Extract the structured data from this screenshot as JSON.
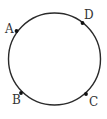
{
  "diagram": {
    "type": "circle-with-points",
    "canvas": {
      "width": 107,
      "height": 119
    },
    "stroke_color": "#2a2a2a",
    "point_color": "#111111",
    "label_color": "#333333",
    "circle": {
      "cx": 54.5,
      "cy": 59,
      "r": 46
    },
    "points": [
      {
        "label": "A",
        "x": 16.5,
        "y": 31,
        "label_x": 5,
        "label_y": 33
      },
      {
        "label": "D",
        "x": 82.5,
        "y": 23,
        "label_x": 84,
        "label_y": 19
      },
      {
        "label": "B",
        "x": 21,
        "y": 93,
        "label_x": 12,
        "label_y": 104
      },
      {
        "label": "C",
        "x": 86,
        "y": 94,
        "label_x": 89,
        "label_y": 106
      }
    ]
  }
}
